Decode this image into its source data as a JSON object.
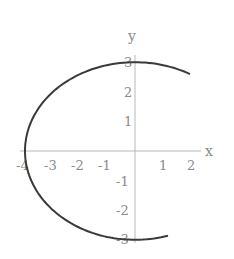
{
  "chart_data": {
    "type": "line",
    "title": "",
    "xlabel": "x",
    "ylabel": "y",
    "xlim": [
      -4.2,
      2.4
    ],
    "ylim": [
      -3.0,
      3.0
    ],
    "grid": false,
    "x_ticks": [
      "-4",
      "-3",
      "-2",
      "-1",
      "1",
      "2"
    ],
    "y_ticks": [
      "3",
      "2",
      "1",
      "-1",
      "-2",
      "-3"
    ],
    "series": [
      {
        "name": "curve",
        "description": "partial ellipse x^2/16 + y^2/9 = 1",
        "x": [
          2.0,
          1.0,
          0.0,
          -1.0,
          -2.0,
          -3.0,
          -3.5,
          -4.0,
          -3.5,
          -3.0,
          -2.0,
          -1.0,
          0.0,
          1.0,
          1.2
        ],
        "y": [
          2.6,
          2.9,
          3.0,
          2.9,
          2.6,
          1.98,
          1.45,
          0.0,
          -1.45,
          -1.98,
          -2.6,
          -2.9,
          -3.0,
          -2.9,
          -2.86
        ]
      }
    ],
    "colors": {
      "curve": "#3a3a3a",
      "axes": "#b0b0b0",
      "labels": "#8a8a8a"
    }
  }
}
